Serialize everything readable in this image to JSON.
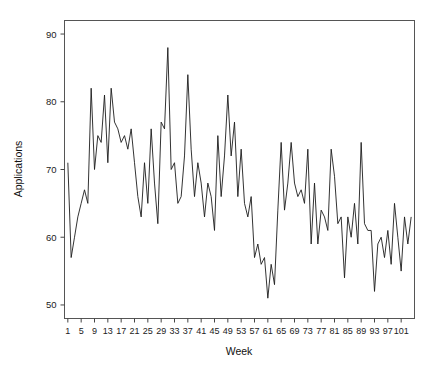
{
  "chart_data": {
    "type": "line",
    "title": "",
    "xlabel": "Week",
    "ylabel": "Applications",
    "xlim": [
      0,
      105
    ],
    "ylim": [
      48,
      92
    ],
    "grid": false,
    "legend": "none",
    "xticks": [
      1,
      5,
      9,
      13,
      17,
      21,
      25,
      29,
      33,
      37,
      41,
      45,
      49,
      53,
      57,
      61,
      65,
      69,
      73,
      77,
      81,
      85,
      89,
      93,
      97,
      101
    ],
    "yticks": [
      50,
      60,
      70,
      80,
      90
    ],
    "series": [
      {
        "name": "Applications",
        "color": "#1c1c1c",
        "x": [
          1,
          2,
          3,
          4,
          5,
          6,
          7,
          8,
          9,
          10,
          11,
          12,
          13,
          14,
          15,
          16,
          17,
          18,
          19,
          20,
          21,
          22,
          23,
          24,
          25,
          26,
          27,
          28,
          29,
          30,
          31,
          32,
          33,
          34,
          35,
          36,
          37,
          38,
          39,
          40,
          41,
          42,
          43,
          44,
          45,
          46,
          47,
          48,
          49,
          50,
          51,
          52,
          53,
          54,
          55,
          56,
          57,
          58,
          59,
          60,
          61,
          62,
          63,
          64,
          65,
          66,
          67,
          68,
          69,
          70,
          71,
          72,
          73,
          74,
          75,
          76,
          77,
          78,
          79,
          80,
          81,
          82,
          83,
          84,
          85,
          86,
          87,
          88,
          89,
          90,
          91,
          92,
          93,
          94,
          95,
          96,
          97,
          98,
          99,
          100,
          101,
          102,
          103,
          104
        ],
        "values": [
          71,
          57,
          60,
          63,
          65,
          67,
          65,
          82,
          70,
          75,
          74,
          81,
          71,
          82,
          77,
          76,
          74,
          75,
          73,
          76,
          71,
          66,
          63,
          71,
          65,
          76,
          68,
          62,
          77,
          76,
          88,
          70,
          71,
          65,
          66,
          72,
          84,
          73,
          66,
          71,
          68,
          63,
          68,
          66,
          61,
          75,
          66,
          72,
          81,
          72,
          77,
          66,
          73,
          65,
          63,
          66,
          57,
          59,
          56,
          57,
          51,
          56,
          53,
          64,
          74,
          64,
          68,
          74,
          68,
          66,
          67,
          65,
          73,
          59,
          68,
          59,
          64,
          63,
          61,
          73,
          69,
          62,
          63,
          54,
          63,
          60,
          65,
          59,
          74,
          62,
          61,
          61,
          52,
          59,
          60,
          57,
          61,
          56,
          65,
          60,
          55,
          63,
          59,
          63
        ]
      }
    ]
  },
  "labels": {
    "y_axis_title": "Applications",
    "x_axis_title": "Week"
  }
}
